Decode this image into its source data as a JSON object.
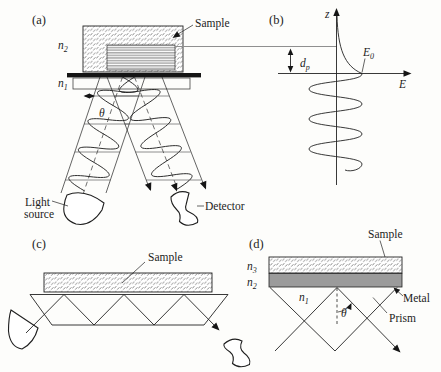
{
  "colors": {
    "ink": "#222222",
    "metal": "#9b9b9b",
    "paper": "#fdfdfb",
    "reference_line": "#8f8f8f"
  },
  "panel_a": {
    "tag": "(a)",
    "sample_label": "Sample",
    "n2_base": "n",
    "n2_sub": "2",
    "n1_base": "n",
    "n1_sub": "1",
    "theta": "θ",
    "light_label_line1": "Light",
    "light_label_line2": "source",
    "detector_label": "Detector"
  },
  "panel_b": {
    "tag": "(b)",
    "z_axis_label": "z",
    "e_axis_label": "E",
    "e0_base": "E",
    "e0_sub": "0",
    "dp_base": "d",
    "dp_sub": "p"
  },
  "panel_c": {
    "tag": "(c)",
    "sample_label": "Sample"
  },
  "panel_d": {
    "tag": "(d)",
    "sample_label": "Sample",
    "metal_label": "Metal",
    "prism_label": "Prism",
    "theta": "θ",
    "n3_base": "n",
    "n3_sub": "3",
    "n2_base": "n",
    "n2_sub": "2",
    "n1_base": "n",
    "n1_sub": "1"
  }
}
